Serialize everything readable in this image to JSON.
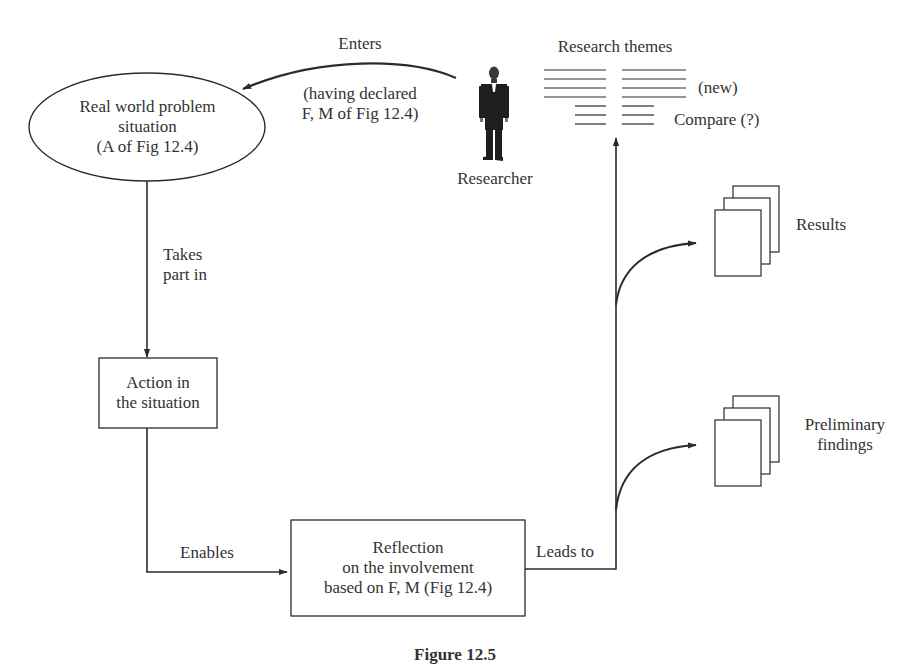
{
  "figure": {
    "caption": "Figure 12.5",
    "nodes": {
      "real_world": {
        "line1": "Real world problem",
        "line2": "situation",
        "line3": "(A of Fig 12.4)"
      },
      "action": {
        "line1": "Action in",
        "line2": "the situation"
      },
      "reflection": {
        "line1": "Reflection",
        "line2": "on the involvement",
        "line3": "based on F, M (Fig 12.4)"
      },
      "researcher": {
        "label": "Researcher"
      },
      "research_themes": {
        "title": "Research themes",
        "new_label": "(new)",
        "compare_label": "Compare (?)"
      },
      "results": {
        "label": "Results"
      },
      "preliminary_findings": {
        "line1": "Preliminary",
        "line2": "findings"
      }
    },
    "edges": {
      "enters": {
        "label": "Enters",
        "sub1": "(having declared",
        "sub2": "F, M of Fig 12.4)"
      },
      "takes_part_in": {
        "line1": "Takes",
        "line2": "part in"
      },
      "enables": {
        "label": "Enables"
      },
      "leads_to": {
        "label": "Leads to"
      }
    },
    "colors": {
      "stroke": "#2b2b2b",
      "text": "#333333",
      "background": "#ffffff"
    }
  }
}
